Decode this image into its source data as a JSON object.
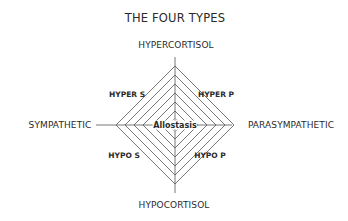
{
  "title": "THE FOUR TYPES",
  "axes": {
    "top": "HYPERCORTISOL",
    "bottom": "HYPOCORTISOL",
    "left": "SYMPATHETIC",
    "right": "PARASYMPATHETIC"
  },
  "quadrants": {
    "top_left": "HYPER S",
    "top_right": "HYPER P",
    "bottom_left": "HYPO S",
    "bottom_right": "HYPO P"
  },
  "center": "Allostasis",
  "colors": {
    "line": "#555555",
    "text": "#2a2a2a",
    "background": "#ffffff"
  }
}
